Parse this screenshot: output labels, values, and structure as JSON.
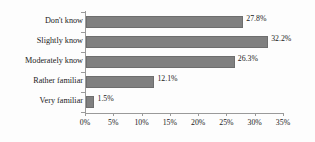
{
  "chart_data": {
    "type": "bar",
    "orientation": "horizontal",
    "title": "",
    "subtitle": "",
    "xlabel": "",
    "ylabel": "",
    "categories": [
      "Don't know",
      "Slightly know",
      "Moderately know",
      "Rather familiar",
      "Very familiar"
    ],
    "values": [
      27.8,
      32.2,
      26.3,
      12.1,
      1.5
    ],
    "data_labels": [
      "27.8%",
      "32.2%",
      "26.3%",
      "12.1%",
      "1.5%"
    ],
    "xlim": [
      0,
      35
    ],
    "xtick_values": [
      0,
      5,
      10,
      15,
      20,
      25,
      30,
      35
    ],
    "xtick_labels": [
      "0%",
      "5%",
      "10%",
      "15%",
      "20%",
      "25%",
      "30%",
      "35%"
    ],
    "grid": false,
    "legend": false,
    "bar_color": "#808080",
    "bar_border_color": "#6e6e6e",
    "axis_color": "#9a9a9a",
    "text_color": "#1a1a1a",
    "background_color": "#fdfdfd"
  }
}
